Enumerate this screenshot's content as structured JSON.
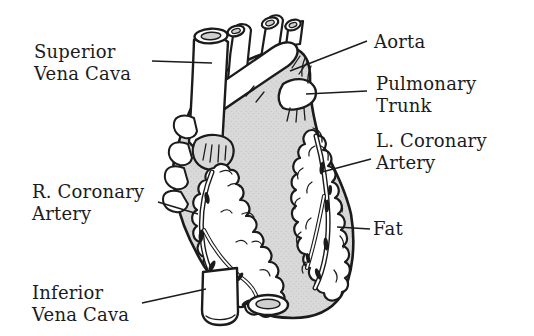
{
  "figure": {
    "colors": {
      "background": "#ffffff",
      "ink": "#1b1b1b",
      "heart_fill": "#d9d9d9",
      "vessel_inner": "#cfcfcf"
    }
  },
  "labels": [
    {
      "id": "superior-vena-cava",
      "lines": [
        "Superior",
        "Vena Cava"
      ]
    },
    {
      "id": "aorta",
      "lines": [
        "Aorta"
      ]
    },
    {
      "id": "pulmonary-trunk",
      "lines": [
        "Pulmonary",
        "Trunk"
      ]
    },
    {
      "id": "l-coronary-artery",
      "lines": [
        "L. Coronary",
        "Artery"
      ]
    },
    {
      "id": "r-coronary-artery",
      "lines": [
        "R. Coronary",
        "Artery"
      ]
    },
    {
      "id": "fat",
      "lines": [
        "Fat"
      ]
    },
    {
      "id": "inferior-vena-cava",
      "lines": [
        "Inferior",
        "Vena Cava"
      ]
    }
  ]
}
